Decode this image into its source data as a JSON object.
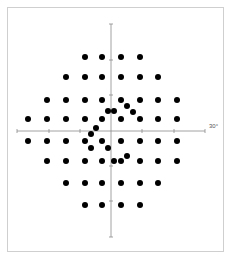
{
  "figure": {
    "title": "",
    "axis_label_right": "30°",
    "colors": {
      "dot": "#000000",
      "axis": "#8a8a8a",
      "frame": "#cfcfcf",
      "background": "#ffffff"
    }
  },
  "chart_data": {
    "type": "scatter",
    "title": "",
    "xlabel": "",
    "ylabel": "",
    "annotations": [
      "30°"
    ],
    "units": "degrees of visual field",
    "xlim": [
      -30,
      30
    ],
    "ylim": [
      -30,
      30
    ],
    "grid": false,
    "axis_ticks_deg": [
      -30,
      -20,
      -10,
      10,
      20,
      30
    ],
    "grid_points_deg": [
      [
        -9,
        27
      ],
      [
        -3,
        27
      ],
      [
        3,
        27
      ],
      [
        9,
        27
      ],
      [
        -15,
        21
      ],
      [
        -9,
        21
      ],
      [
        -3,
        21
      ],
      [
        3,
        21
      ],
      [
        9,
        21
      ],
      [
        15,
        21
      ],
      [
        -21,
        15
      ],
      [
        -15,
        15
      ],
      [
        -9,
        15
      ],
      [
        -3,
        15
      ],
      [
        3,
        15
      ],
      [
        9,
        15
      ],
      [
        15,
        15
      ],
      [
        21,
        15
      ],
      [
        -27,
        9
      ],
      [
        -21,
        9
      ],
      [
        -15,
        9
      ],
      [
        -9,
        9
      ],
      [
        -3,
        9
      ],
      [
        3,
        9
      ],
      [
        9,
        9
      ],
      [
        15,
        9
      ],
      [
        21,
        9
      ],
      [
        -27,
        -3
      ],
      [
        -21,
        -3
      ],
      [
        -15,
        -3
      ],
      [
        -9,
        -3
      ],
      [
        -3,
        -3
      ],
      [
        3,
        -3
      ],
      [
        9,
        -3
      ],
      [
        15,
        -3
      ],
      [
        21,
        -3
      ],
      [
        -21,
        -9
      ],
      [
        -15,
        -9
      ],
      [
        -9,
        -9
      ],
      [
        -3,
        -9
      ],
      [
        3,
        -9
      ],
      [
        9,
        -9
      ],
      [
        15,
        -9
      ],
      [
        21,
        -9
      ],
      [
        -15,
        -15
      ],
      [
        -9,
        -15
      ],
      [
        -3,
        -15
      ],
      [
        3,
        -15
      ],
      [
        9,
        -15
      ],
      [
        15,
        -15
      ],
      [
        -9,
        -21
      ],
      [
        -3,
        -21
      ],
      [
        3,
        -21
      ],
      [
        9,
        -21
      ]
    ],
    "extra_points_deg": [
      [
        -1,
        6
      ],
      [
        1,
        6
      ],
      [
        5,
        8
      ],
      [
        7,
        5
      ],
      [
        -5,
        1
      ],
      [
        -6,
        -1
      ],
      [
        -6,
        -6
      ],
      [
        -1,
        -6
      ],
      [
        1,
        -10
      ],
      [
        5,
        -8
      ]
    ]
  },
  "dots_px": {
    "grid": [
      [
        85,
        57
      ],
      [
        102,
        57
      ],
      [
        121,
        57
      ],
      [
        140,
        57
      ],
      [
        66,
        77
      ],
      [
        85,
        77
      ],
      [
        102,
        77
      ],
      [
        121,
        77
      ],
      [
        140,
        77
      ],
      [
        158,
        77
      ],
      [
        47,
        100
      ],
      [
        66,
        100
      ],
      [
        85,
        100
      ],
      [
        102,
        100
      ],
      [
        121,
        100
      ],
      [
        140,
        100
      ],
      [
        158,
        100
      ],
      [
        177,
        100
      ],
      [
        28,
        119
      ],
      [
        47,
        119
      ],
      [
        66,
        119
      ],
      [
        85,
        119
      ],
      [
        102,
        119
      ],
      [
        121,
        119
      ],
      [
        140,
        119
      ],
      [
        158,
        119
      ],
      [
        177,
        119
      ],
      [
        28,
        141
      ],
      [
        47,
        141
      ],
      [
        66,
        141
      ],
      [
        85,
        141
      ],
      [
        102,
        141
      ],
      [
        121,
        141
      ],
      [
        140,
        141
      ],
      [
        158,
        141
      ],
      [
        177,
        141
      ],
      [
        47,
        161
      ],
      [
        66,
        161
      ],
      [
        85,
        161
      ],
      [
        102,
        161
      ],
      [
        121,
        161
      ],
      [
        140,
        161
      ],
      [
        158,
        161
      ],
      [
        177,
        161
      ],
      [
        66,
        183
      ],
      [
        85,
        183
      ],
      [
        102,
        183
      ],
      [
        121,
        183
      ],
      [
        140,
        183
      ],
      [
        158,
        183
      ],
      [
        85,
        205
      ],
      [
        102,
        205
      ],
      [
        121,
        205
      ],
      [
        140,
        205
      ]
    ],
    "extra": [
      [
        108,
        111
      ],
      [
        114,
        111
      ],
      [
        127,
        106
      ],
      [
        133,
        112
      ],
      [
        96,
        128
      ],
      [
        91,
        134
      ],
      [
        91,
        148
      ],
      [
        108,
        148
      ],
      [
        114,
        161
      ],
      [
        127,
        156
      ]
    ]
  }
}
